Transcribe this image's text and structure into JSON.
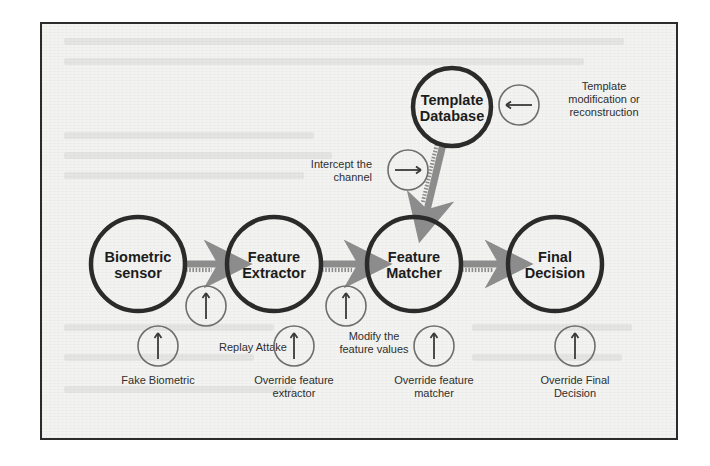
{
  "figure": {
    "colors": {
      "frame": "#2b2b2b",
      "page": "#f3f3f1",
      "node_stroke": "#2b2b2b",
      "arrow": "#8c8c8c",
      "attack_circle": "#6e6e6e",
      "text": "#1c1c1c"
    }
  },
  "nodes": [
    {
      "id": "biometric-sensor",
      "line1": "Biometric",
      "line2": "sensor",
      "cx": 96,
      "cy": 240,
      "r": 47
    },
    {
      "id": "feature-extractor",
      "line1": "Feature",
      "line2": "Extractor",
      "cx": 232,
      "cy": 240,
      "r": 47
    },
    {
      "id": "feature-matcher",
      "line1": "Feature",
      "line2": "Matcher",
      "cx": 372,
      "cy": 240,
      "r": 47
    },
    {
      "id": "final-decision",
      "line1": "Final",
      "line2": "Decision",
      "cx": 513,
      "cy": 240,
      "r": 47
    },
    {
      "id": "template-database",
      "line1": "Template",
      "line2": "Database",
      "cx": 410,
      "cy": 83,
      "r": 39
    }
  ],
  "flow_arrows": [
    {
      "id": "sensor-to-extractor",
      "from": "biometric-sensor",
      "to": "feature-extractor"
    },
    {
      "id": "extractor-to-matcher",
      "from": "feature-extractor",
      "to": "feature-matcher"
    },
    {
      "id": "matcher-to-decision",
      "from": "feature-matcher",
      "to": "final-decision"
    },
    {
      "id": "database-to-matcher",
      "from": "template-database",
      "to": "feature-matcher"
    }
  ],
  "attacks": [
    {
      "id": "fake-biometric",
      "glyph": "up-arrow",
      "cx": 116,
      "cy": 322,
      "r": 20,
      "label_line1": "Fake Biometric",
      "label_line2": "",
      "label_x": 116,
      "label_y": 360
    },
    {
      "id": "replay-attack",
      "glyph": "up-arrow",
      "cx": 164,
      "cy": 282,
      "r": 20,
      "label_line1": "Replay Attake",
      "label_line2": "",
      "label_x": 211,
      "label_y": 327
    },
    {
      "id": "override-feature-extractor",
      "glyph": "up-arrow",
      "cx": 252,
      "cy": 322,
      "r": 20,
      "label_line1": "Override feature",
      "label_line2": "extractor",
      "label_x": 252,
      "label_y": 360
    },
    {
      "id": "modify-feature-values",
      "glyph": "up-arrow",
      "cx": 304,
      "cy": 282,
      "r": 20,
      "label_line1": "Modify the",
      "label_line2": "feature values",
      "label_x": 332,
      "label_y": 316
    },
    {
      "id": "override-feature-matcher",
      "glyph": "up-arrow",
      "cx": 392,
      "cy": 322,
      "r": 20,
      "label_line1": "Override feature",
      "label_line2": "matcher",
      "label_x": 392,
      "label_y": 360
    },
    {
      "id": "override-final-decision",
      "glyph": "up-arrow",
      "cx": 533,
      "cy": 322,
      "r": 20,
      "label_line1": "Override Final",
      "label_line2": "Decision",
      "label_x": 533,
      "label_y": 360
    },
    {
      "id": "intercept-the-channel",
      "glyph": "right-arrow",
      "cx": 366,
      "cy": 146,
      "r": 20,
      "label_line1": "Intercept the",
      "label_line2": "channel",
      "label_x": 330,
      "label_y": 144,
      "label_anchor": "end"
    },
    {
      "id": "template-modification",
      "glyph": "left-arrow",
      "cx": 477,
      "cy": 81,
      "r": 20,
      "label_line1": "Template",
      "label_line2": "modification or",
      "label_line3": "reconstruction",
      "label_x": 562,
      "label_y": 66
    }
  ]
}
